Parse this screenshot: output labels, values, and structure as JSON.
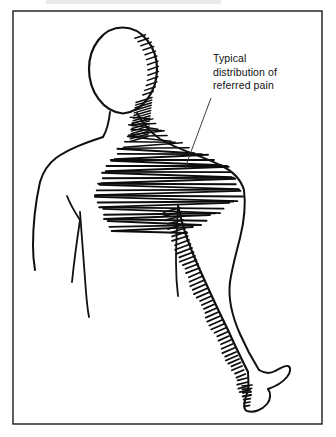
{
  "figure": {
    "kind": "anatomical-line-drawing",
    "background_color": "#ffffff",
    "ink_color": "#111111",
    "frame": {
      "name": "illustration-border",
      "x": 13,
      "y": 11,
      "width": 309,
      "height": 413,
      "stroke_color": "#1a1a1a"
    },
    "annotation": {
      "name": "referred-pain-callout",
      "lines": [
        "Typical",
        "distribution of",
        "referred pain"
      ],
      "text_x": 213,
      "text_y": 62,
      "line_height": 13.5,
      "font_size": 10.5,
      "leader": {
        "from_x": 211,
        "from_y": 98,
        "to_x": 185,
        "to_y": 168,
        "stroke_color": "#2a2a2a"
      }
    },
    "hatching": {
      "description": "dense pen hatching marking the referred pain region over the right neck, trapezius, shoulder and down the inner arm to the hand",
      "color": "#0d0d0d",
      "shoulder_pitch_px": 3,
      "arm_tick_pitch_px": 4.2
    },
    "regions": [
      {
        "name": "head",
        "hatched": false
      },
      {
        "name": "neck-right",
        "hatched": true
      },
      {
        "name": "trapezius-right",
        "hatched": true
      },
      {
        "name": "shoulder-deltoid-right",
        "hatched": true
      },
      {
        "name": "upper-arm-right",
        "hatched": true
      },
      {
        "name": "forearm-right",
        "hatched": true
      },
      {
        "name": "hand-right",
        "hatched": true
      },
      {
        "name": "shoulder-left",
        "hatched": false
      },
      {
        "name": "arm-left",
        "hatched": false
      },
      {
        "name": "chest",
        "hatched": false
      }
    ]
  }
}
